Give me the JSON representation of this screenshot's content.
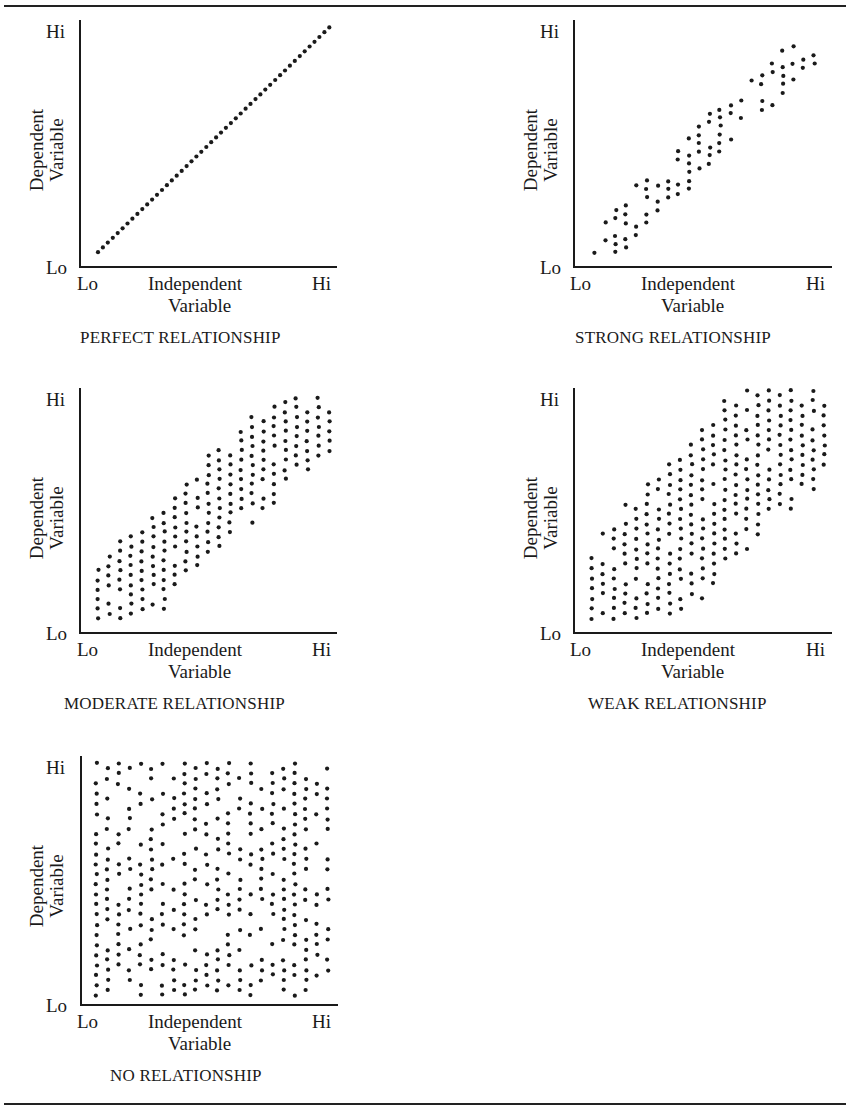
{
  "chart_data": [
    {
      "type": "scatter",
      "title": "PERFECT RELATIONSHIP",
      "xlabel": "Independent Variable",
      "ylabel": "Dependent Variable",
      "x_ticks": [
        "Lo",
        "Hi"
      ],
      "y_ticks": [
        "Lo",
        "Hi"
      ],
      "xlim": [
        0,
        1
      ],
      "ylim": [
        0,
        1
      ],
      "grid": false,
      "pattern": "line",
      "description": "Dots lie exactly on a straight diagonal line from low-left to high-right",
      "points": {
        "generator": "line",
        "count": 48,
        "from": [
          0.07,
          0.06
        ],
        "to": [
          0.97,
          0.97
        ]
      }
    },
    {
      "type": "scatter",
      "title": "STRONG RELATIONSHIP",
      "xlabel": "Independent Variable",
      "ylabel": "Dependent Variable",
      "x_ticks": [
        "Lo",
        "Hi"
      ],
      "y_ticks": [
        "Lo",
        "Hi"
      ],
      "xlim": [
        0,
        1
      ],
      "ylim": [
        0,
        1
      ],
      "grid": false,
      "pattern": "narrow-band",
      "description": "Dots clustered in a narrow diagonal band",
      "points": {
        "generator": "band",
        "seed": 11,
        "cols": 22,
        "rows": 26,
        "x0": 0.08,
        "x1": 0.93,
        "y0": 0.06,
        "y1": 0.91,
        "halfwidth": 0.11,
        "density": 0.62
      }
    },
    {
      "type": "scatter",
      "title": "MODERATE RELATIONSHIP",
      "xlabel": "Independent Variable",
      "ylabel": "Dependent Variable",
      "x_ticks": [
        "Lo",
        "Hi"
      ],
      "y_ticks": [
        "Lo",
        "Hi"
      ],
      "xlim": [
        0,
        1
      ],
      "ylim": [
        0,
        1
      ],
      "grid": false,
      "pattern": "medium-band",
      "description": "Dots in a wider diagonal band",
      "points": {
        "generator": "band",
        "seed": 23,
        "cols": 22,
        "rows": 24,
        "x0": 0.07,
        "x1": 0.97,
        "y0": 0.06,
        "y1": 0.96,
        "halfwidth": 0.21,
        "density": 0.92
      }
    },
    {
      "type": "scatter",
      "title": "WEAK RELATIONSHIP",
      "xlabel": "Independent Variable",
      "ylabel": "Dependent Variable",
      "x_ticks": [
        "Lo",
        "Hi"
      ],
      "y_ticks": [
        "Lo",
        "Hi"
      ],
      "xlim": [
        0,
        1
      ],
      "ylim": [
        0,
        1
      ],
      "grid": false,
      "pattern": "wide-band",
      "description": "Dots in a broad diagonal cloud",
      "points": {
        "generator": "band",
        "seed": 37,
        "cols": 22,
        "rows": 24,
        "x0": 0.07,
        "x1": 0.97,
        "y0": 0.06,
        "y1": 0.99,
        "halfwidth": 0.33,
        "density": 0.93
      }
    },
    {
      "type": "scatter",
      "title": "NO RELATIONSHIP",
      "xlabel": "Independent Variable",
      "ylabel": "Dependent Variable",
      "x_ticks": [
        "Lo",
        "Hi"
      ],
      "y_ticks": [
        "Lo",
        "Hi"
      ],
      "xlim": [
        0,
        1
      ],
      "ylim": [
        0,
        1
      ],
      "grid": false,
      "pattern": "uniform",
      "description": "Dots spread uniformly across the entire plot area",
      "points": {
        "generator": "uniform",
        "seed": 53,
        "cols": 22,
        "rows": 24,
        "x0": 0.06,
        "x1": 0.96,
        "y0": 0.04,
        "y1": 0.97,
        "density": 0.66
      }
    }
  ],
  "panels": [
    {
      "title": "PERFECT RELATIONSHIP",
      "x_lo": "Lo",
      "x_hi": "Hi",
      "y_lo": "Lo",
      "y_hi": "Hi",
      "x_label_1": "Independent",
      "x_label_2": "Variable",
      "y_label_1": "Dependent",
      "y_label_2": "Variable"
    },
    {
      "title": "STRONG RELATIONSHIP",
      "x_lo": "Lo",
      "x_hi": "Hi",
      "y_lo": "Lo",
      "y_hi": "Hi",
      "x_label_1": "Independent",
      "x_label_2": "Variable",
      "y_label_1": "Dependent",
      "y_label_2": "Variable"
    },
    {
      "title": "MODERATE RELATIONSHIP",
      "x_lo": "Lo",
      "x_hi": "Hi",
      "y_lo": "Lo",
      "y_hi": "Hi",
      "x_label_1": "Independent",
      "x_label_2": "Variable",
      "y_label_1": "Dependent",
      "y_label_2": "Variable"
    },
    {
      "title": "WEAK RELATIONSHIP",
      "x_lo": "Lo",
      "x_hi": "Hi",
      "y_lo": "Lo",
      "y_hi": "Hi",
      "x_label_1": "Independent",
      "x_label_2": "Variable",
      "y_label_1": "Dependent",
      "y_label_2": "Variable"
    },
    {
      "title": "NO RELATIONSHIP",
      "x_lo": "Lo",
      "x_hi": "Hi",
      "y_lo": "Lo",
      "y_hi": "Hi",
      "x_label_1": "Independent",
      "x_label_2": "Variable",
      "y_label_1": "Dependent",
      "y_label_2": "Variable"
    }
  ],
  "colors": {
    "ink": "#1a1a1a",
    "background": "#ffffff"
  }
}
